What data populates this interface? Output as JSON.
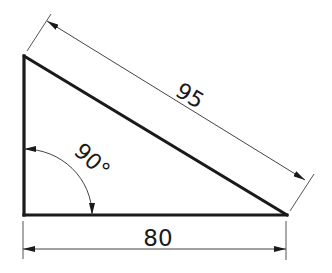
{
  "diagram": {
    "type": "right-triangle-dimension-drawing",
    "colors": {
      "stroke": "#1a1a1a",
      "dimension": "#444444",
      "background": "#ffffff"
    },
    "dimensions": {
      "hypotenuse": {
        "label": "95"
      },
      "base": {
        "label": "80"
      },
      "angle": {
        "label": "90°"
      }
    }
  }
}
